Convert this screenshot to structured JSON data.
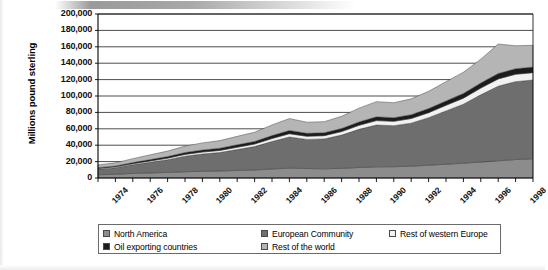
{
  "chart_data": {
    "type": "area",
    "stacked": true,
    "title": "",
    "subtitle": "",
    "xlabel": "",
    "ylabel": "Millions pound sterling",
    "ylim": [
      0,
      200000
    ],
    "ytick_values": [
      0,
      20000,
      40000,
      60000,
      80000,
      100000,
      120000,
      140000,
      160000,
      180000,
      200000
    ],
    "ytick_labels": [
      "0",
      "20,000",
      "40,000",
      "60,000",
      "80,000",
      "100,000",
      "120,000",
      "140,000",
      "160,000",
      "180,000",
      "200,000"
    ],
    "grid": true,
    "grid_axis": "y",
    "legend_position": "bottom",
    "x": [
      1974,
      1975,
      1976,
      1977,
      1978,
      1979,
      1980,
      1981,
      1982,
      1983,
      1984,
      1985,
      1986,
      1987,
      1988,
      1989,
      1990,
      1991,
      1992,
      1993,
      1994,
      1995,
      1996,
      1997,
      1998,
      1999
    ],
    "xtick_labels": [
      "1974",
      "1976",
      "1978",
      "1980",
      "1982",
      "1984",
      "1986",
      "1988",
      "1990",
      "1992",
      "1994",
      "1996",
      "1998"
    ],
    "xtick_label_years": [
      1974,
      1976,
      1978,
      1980,
      1982,
      1984,
      1986,
      1988,
      1990,
      1992,
      1994,
      1996,
      1998
    ],
    "series": [
      {
        "name": "North America",
        "color": "#8c8c8c",
        "values": [
          4000,
          4600,
          5600,
          6200,
          6800,
          7600,
          8200,
          8600,
          9200,
          9800,
          11000,
          12000,
          11600,
          11200,
          11800,
          12800,
          13600,
          13800,
          14400,
          15600,
          16800,
          18000,
          19500,
          21000,
          22500,
          23500
        ]
      },
      {
        "name": "European Community",
        "color": "#6e6e6e",
        "values": [
          6800,
          8000,
          10500,
          13000,
          15500,
          19000,
          21000,
          22500,
          25500,
          28500,
          33500,
          38000,
          35500,
          36500,
          40500,
          46500,
          51000,
          50000,
          52500,
          58000,
          65000,
          72000,
          82000,
          91000,
          95000,
          96000
        ]
      },
      {
        "name": "Rest of western Europe",
        "color": "#f2f2f2",
        "values": [
          900,
          1000,
          1300,
          1600,
          1900,
          2200,
          2400,
          2500,
          2800,
          3100,
          3600,
          4000,
          3800,
          3900,
          4300,
          4900,
          5400,
          5300,
          5600,
          6100,
          6800,
          7400,
          8200,
          8800,
          9000,
          9000
        ]
      },
      {
        "name": "Oil exporting countries",
        "color": "#1c1c1c",
        "values": [
          900,
          1100,
          1400,
          1700,
          2000,
          2300,
          2600,
          2800,
          3000,
          3200,
          3600,
          4000,
          3700,
          3600,
          3800,
          4200,
          4600,
          4500,
          4700,
          5000,
          5400,
          5800,
          6200,
          6600,
          6800,
          6800
        ]
      },
      {
        "name": "Rest of the world",
        "color": "#b5b5b5",
        "values": [
          3400,
          3800,
          4800,
          5800,
          6600,
          7800,
          8600,
          9200,
          10300,
          11200,
          13000,
          14500,
          13500,
          13500,
          14800,
          16800,
          18500,
          18200,
          19300,
          21000,
          23500,
          25800,
          29000,
          36000,
          28000,
          26500
        ]
      }
    ],
    "totals": [
      16000,
      18500,
      23600,
      28300,
      32800,
      38900,
      42800,
      45600,
      50800,
      55800,
      64700,
      72500,
      68100,
      68700,
      75200,
      85200,
      93100,
      91800,
      96500,
      105700,
      117500,
      129000,
      144900,
      163400,
      161300,
      161800
    ]
  },
  "legend": {
    "entries": [
      {
        "label": "North America",
        "color": "#8c8c8c"
      },
      {
        "label": "European Community",
        "color": "#6e6e6e"
      },
      {
        "label": "Rest of western Europe",
        "color": "#f2f2f2"
      },
      {
        "label": "Oil exporting countries",
        "color": "#1c1c1c"
      },
      {
        "label": "Rest of the world",
        "color": "#b5b5b5"
      }
    ]
  }
}
